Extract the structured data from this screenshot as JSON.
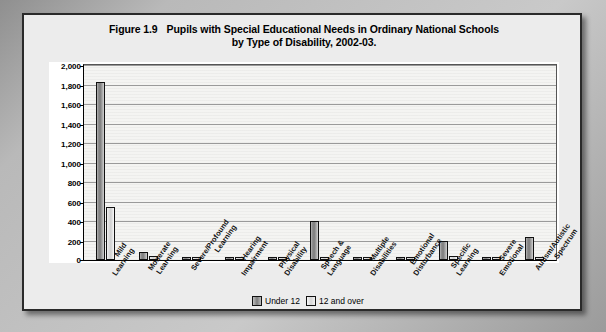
{
  "figure": {
    "number": "Figure 1.9",
    "title_line1": "Pupils with Special Educational Needs in Ordinary National Schools",
    "title_line2": "by Type of Disability, 2002-03."
  },
  "legend": {
    "under12_label": "Under 12",
    "over12_label": "12 and over",
    "under12_color": "#7d7d7d",
    "over12_color": "#dcdcdc",
    "position": "bottom-center"
  },
  "chart_data": {
    "type": "bar",
    "xlabel": "",
    "ylabel": "",
    "ylim": [
      0,
      2000
    ],
    "ytick_step": 200,
    "grid": true,
    "ytick_labels": [
      "0",
      "200",
      "400",
      "600",
      "800",
      "1,000",
      "1,200",
      "1,400",
      "1,600",
      "1,800",
      "2,000"
    ],
    "categories": [
      "Mild Learning",
      "Moderate Learning",
      "Severe/Profound Learning",
      "Hearing Impairment",
      "Physical Disability",
      "Speech & Language",
      "Multiple Disabilities",
      "Emotional Disturbance",
      "Specific Learning",
      "Severe Emotional",
      "Autism/Autistic Spectrum"
    ],
    "category_lines": [
      [
        "Mild",
        "Learning"
      ],
      [
        "Moderate",
        "Learning"
      ],
      [
        "Severe/Profound",
        "Learning"
      ],
      [
        "Hearing",
        "Impairment"
      ],
      [
        "Physical",
        "Disability"
      ],
      [
        "Speech &",
        "Language"
      ],
      [
        "Multiple",
        "Disabilities"
      ],
      [
        "Emotional",
        "Disturbance"
      ],
      [
        "Specific",
        "Learning"
      ],
      [
        "Severe",
        "Emotional"
      ],
      [
        "Autism/Autistic",
        "Spectrum"
      ]
    ],
    "series": [
      {
        "name": "Under 12",
        "values": [
          1830,
          85,
          10,
          20,
          12,
          405,
          15,
          18,
          195,
          8,
          240
        ]
      },
      {
        "name": "12 and over",
        "values": [
          540,
          40,
          5,
          12,
          10,
          25,
          8,
          12,
          40,
          5,
          30
        ]
      }
    ]
  }
}
